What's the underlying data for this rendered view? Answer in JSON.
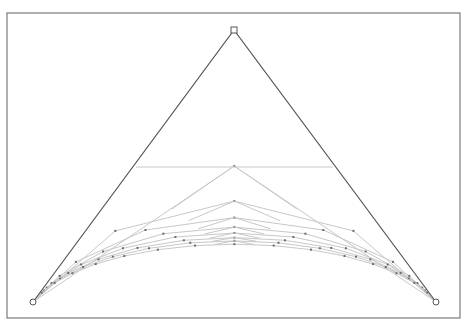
{
  "diagram": {
    "type": "rational-quadratic-bezier-construction",
    "frame": {
      "x": 7,
      "y": 13,
      "width": 453,
      "height": 305,
      "stroke": "#7a7a7a"
    },
    "control_points": [
      {
        "name": "P0",
        "x": 33,
        "y": 302,
        "marker": "circle"
      },
      {
        "name": "P1",
        "x": 234,
        "y": 30,
        "marker": "square"
      },
      {
        "name": "P2",
        "x": 436,
        "y": 302,
        "marker": "circle"
      }
    ],
    "control_polygon_color": "#555555",
    "construction_color": "#c8c8c8",
    "point_color": "#6a6a6a",
    "top_chord": {
      "y": 167,
      "x1": 136,
      "x2": 333
    },
    "rows": [
      {
        "weight": 1.0,
        "samples": 2
      },
      {
        "weight": 0.59,
        "samples": 4
      },
      {
        "weight": 0.45,
        "samples": 6
      },
      {
        "weight": 0.38,
        "samples": 8
      },
      {
        "weight": 0.34,
        "samples": 10
      },
      {
        "weight": 0.31,
        "samples": 12
      },
      {
        "weight": 0.29,
        "samples": 14
      },
      {
        "weight": 0.27,
        "samples": 16
      }
    ]
  }
}
